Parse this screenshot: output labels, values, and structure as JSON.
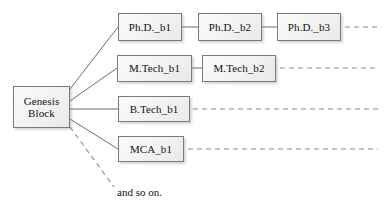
{
  "diagram": {
    "title_text": "",
    "colors": {
      "node_fill": "#f2f2f1",
      "node_border": "#7a7a7a",
      "edge_solid": "#6e6e6e",
      "edge_dashed": "#8a8a8a",
      "text": "#111111",
      "background": "#ffffff"
    },
    "root": {
      "label": "Genesis\nBlock",
      "x": 13,
      "y": 86,
      "w": 57,
      "h": 42
    },
    "branches": [
      {
        "name": "phd-chain",
        "nodes": [
          {
            "label": "Ph.D._b1",
            "x": 118,
            "y": 13,
            "w": 64,
            "h": 28
          },
          {
            "label": "Ph.D._b2",
            "x": 198,
            "y": 13,
            "w": 64,
            "h": 28
          },
          {
            "label": "Ph.D._b3",
            "x": 277,
            "y": 13,
            "w": 64,
            "h": 28
          }
        ],
        "continues": true
      },
      {
        "name": "mtech-chain",
        "nodes": [
          {
            "label": "M.Tech_b1",
            "x": 117,
            "y": 55,
            "w": 75,
            "h": 27
          },
          {
            "label": "M.Tech_b2",
            "x": 202,
            "y": 55,
            "w": 74,
            "h": 27
          }
        ],
        "continues": true
      },
      {
        "name": "btech-chain",
        "nodes": [
          {
            "label": "B.Tech_b1",
            "x": 118,
            "y": 96,
            "w": 72,
            "h": 26
          }
        ],
        "continues": true
      },
      {
        "name": "mca-chain",
        "nodes": [
          {
            "label": "MCA_b1",
            "x": 118,
            "y": 136,
            "w": 66,
            "h": 26
          }
        ],
        "continues": true
      }
    ],
    "ellipsis_note": {
      "label": "and so on.",
      "x": 117,
      "y": 186
    }
  },
  "edges": {
    "solid_links": [
      {
        "name": "root-to-phd-b1",
        "x1": 70,
        "y1": 89,
        "x2": 118,
        "y2": 27
      },
      {
        "name": "root-to-mtech-b1",
        "x1": 70,
        "y1": 101,
        "x2": 117,
        "y2": 68
      },
      {
        "name": "root-to-btech-b1",
        "x1": 70,
        "y1": 109,
        "x2": 118,
        "y2": 109
      },
      {
        "name": "root-to-mca-b1",
        "x1": 70,
        "y1": 119,
        "x2": 118,
        "y2": 149
      },
      {
        "name": "phd-b1-to-phd-b2",
        "x1": 182,
        "y1": 27,
        "x2": 198,
        "y2": 27
      },
      {
        "name": "phd-b2-to-phd-b3",
        "x1": 262,
        "y1": 27,
        "x2": 277,
        "y2": 27
      },
      {
        "name": "mtech-b1-to-mtech-b2",
        "x1": 192,
        "y1": 68,
        "x2": 202,
        "y2": 68
      }
    ],
    "dashed_links": [
      {
        "name": "phd-chain-continues",
        "x1": 345,
        "y1": 27,
        "x2": 378,
        "y2": 27
      },
      {
        "name": "mtech-chain-continues",
        "x1": 280,
        "y1": 68,
        "x2": 378,
        "y2": 68
      },
      {
        "name": "btech-chain-continues",
        "x1": 193,
        "y1": 109,
        "x2": 378,
        "y2": 109
      },
      {
        "name": "mca-chain-continues",
        "x1": 188,
        "y1": 149,
        "x2": 378,
        "y2": 149
      },
      {
        "name": "root-to-and-so-on",
        "x1": 70,
        "y1": 127,
        "x2": 114,
        "y2": 187
      }
    ]
  }
}
